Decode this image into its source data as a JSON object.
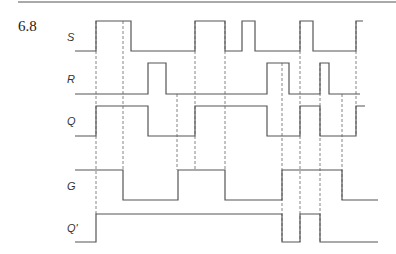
{
  "figure": {
    "number": "6.8",
    "top_rule": {
      "x1": 18,
      "x2": 396,
      "y": 2
    }
  },
  "signals": [
    {
      "name": "S",
      "label_y": 41,
      "high": 21,
      "low": 51,
      "start_x": 75,
      "end_x": 363,
      "initial": "low",
      "transitions": [
        96,
        131,
        195,
        225,
        242,
        255,
        300,
        313,
        356
      ]
    },
    {
      "name": "R",
      "label_y": 83,
      "high": 63,
      "low": 94,
      "start_x": 75,
      "end_x": 360,
      "initial": "low",
      "transitions": [
        148,
        166,
        267,
        289,
        320,
        329
      ]
    },
    {
      "name": "Q",
      "label_y": 125,
      "high": 106,
      "low": 136,
      "start_x": 75,
      "end_x": 365,
      "initial": "low",
      "transitions": [
        96,
        148,
        195,
        267,
        300,
        320,
        356
      ]
    },
    {
      "name": "G",
      "label_y": 190,
      "high": 170,
      "low": 200,
      "start_x": 75,
      "end_x": 378,
      "initial": "high",
      "transitions": [
        123,
        178,
        225,
        282,
        342
      ]
    },
    {
      "name": "Q'",
      "label_y": 232,
      "high": 214,
      "low": 242,
      "start_x": 75,
      "end_x": 378,
      "initial": "low",
      "transitions": [
        96,
        282,
        300,
        320
      ]
    }
  ],
  "dashed_lines": [
    {
      "x": 96,
      "y1": 21,
      "y2": 214
    },
    {
      "x": 123,
      "y1": 21,
      "y2": 170
    },
    {
      "x": 177,
      "y1": 94,
      "y2": 170
    },
    {
      "x": 195,
      "y1": 21,
      "y2": 170
    },
    {
      "x": 225,
      "y1": 21,
      "y2": 170
    },
    {
      "x": 282,
      "y1": 63,
      "y2": 242
    },
    {
      "x": 300,
      "y1": 21,
      "y2": 242
    },
    {
      "x": 320,
      "y1": 63,
      "y2": 242
    },
    {
      "x": 342,
      "y1": 94,
      "y2": 200
    },
    {
      "x": 356,
      "y1": 21,
      "y2": 136
    }
  ]
}
